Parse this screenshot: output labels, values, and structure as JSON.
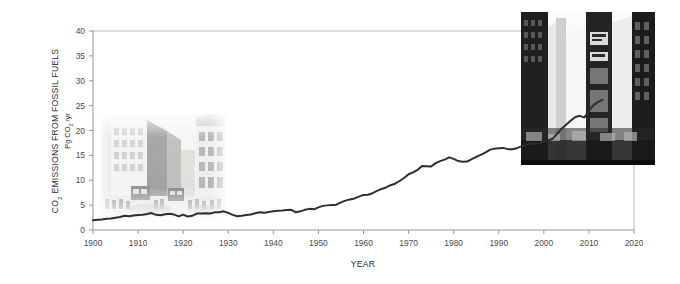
{
  "chart_data": {
    "type": "line",
    "title": "",
    "xlabel": "YEAR",
    "ylabel": "CO2 EMISSIONS FROM FOSSIL FUELS",
    "ylabel_sub": "Pg CO2 /yr",
    "ylabel_main_prefix": "CO",
    "ylabel_main_sub": "2",
    "ylabel_main_rest": " EMISSIONS FROM FOSSIL FUELS",
    "ylabel_units_prefix": "Pg CO",
    "ylabel_units_sub": "2",
    "ylabel_units_rest": " /yr",
    "xlim": [
      1900,
      2020
    ],
    "ylim": [
      0,
      40
    ],
    "xticks": [
      1900,
      1910,
      1920,
      1930,
      1940,
      1950,
      1960,
      1970,
      1980,
      1990,
      2000,
      2010,
      2020
    ],
    "yticks": [
      0,
      5,
      10,
      15,
      20,
      25,
      30,
      35,
      40
    ],
    "grid": false,
    "legend": "none",
    "line_color": "#2e2e2e",
    "axis_color": "#8a8a8a",
    "frame_color": "#b4b4b4",
    "series": [
      {
        "name": "Global CO2 emissions from fossil fuels",
        "x": [
          1900,
          1901,
          1902,
          1903,
          1904,
          1905,
          1906,
          1907,
          1908,
          1909,
          1910,
          1911,
          1912,
          1913,
          1914,
          1915,
          1916,
          1917,
          1918,
          1919,
          1920,
          1921,
          1922,
          1923,
          1924,
          1925,
          1926,
          1927,
          1928,
          1929,
          1930,
          1931,
          1932,
          1933,
          1934,
          1935,
          1936,
          1937,
          1938,
          1939,
          1940,
          1941,
          1942,
          1943,
          1944,
          1945,
          1946,
          1947,
          1948,
          1949,
          1950,
          1951,
          1952,
          1953,
          1954,
          1955,
          1956,
          1957,
          1958,
          1959,
          1960,
          1961,
          1962,
          1963,
          1964,
          1965,
          1966,
          1967,
          1968,
          1969,
          1970,
          1971,
          1972,
          1973,
          1974,
          1975,
          1976,
          1977,
          1978,
          1979,
          1980,
          1981,
          1982,
          1983,
          1984,
          1985,
          1986,
          1987,
          1988,
          1989,
          1990,
          1991,
          1992,
          1993,
          1994,
          1995,
          1996,
          1997,
          1998,
          1999,
          2000,
          2001,
          2002,
          2003,
          2004,
          2005,
          2006,
          2007,
          2008,
          2009,
          2010,
          2011,
          2012,
          2013
        ],
        "values": [
          1.95,
          2.05,
          2.1,
          2.25,
          2.3,
          2.45,
          2.6,
          2.85,
          2.75,
          2.9,
          3.0,
          3.05,
          3.2,
          3.4,
          3.05,
          2.95,
          3.15,
          3.25,
          3.1,
          2.75,
          3.1,
          2.7,
          2.85,
          3.3,
          3.3,
          3.35,
          3.3,
          3.55,
          3.55,
          3.75,
          3.45,
          3.05,
          2.75,
          2.85,
          3.0,
          3.1,
          3.35,
          3.55,
          3.45,
          3.6,
          3.75,
          3.85,
          3.9,
          4.0,
          4.05,
          3.55,
          3.75,
          4.05,
          4.25,
          4.15,
          4.55,
          4.85,
          4.95,
          5.05,
          5.1,
          5.55,
          5.9,
          6.15,
          6.35,
          6.7,
          7.05,
          7.1,
          7.4,
          7.85,
          8.25,
          8.55,
          9.0,
          9.3,
          9.85,
          10.45,
          11.2,
          11.6,
          12.1,
          12.85,
          12.8,
          12.75,
          13.45,
          13.85,
          14.15,
          14.6,
          14.3,
          13.85,
          13.7,
          13.75,
          14.25,
          14.7,
          15.1,
          15.55,
          16.1,
          16.35,
          16.45,
          16.5,
          16.25,
          16.25,
          16.45,
          16.8,
          17.2,
          17.35,
          17.35,
          17.4,
          17.8,
          18.05,
          18.35,
          19.4,
          20.4,
          21.2,
          22.0,
          22.7,
          22.95,
          22.6,
          24.0,
          25.1,
          25.7,
          26.15
        ]
      }
    ],
    "annotations": [
      {
        "name": "vintage-street-photo",
        "description": "Faded black-and-white photograph of an early-1900s city street with trams, carriages and stone buildings, overlaid across the 1905-1930 region of the plot"
      },
      {
        "name": "modern-city-photo",
        "description": "Black-and-white photograph of a modern skyscraper city canyon with large billboards, overlaid across the 1995-2020 region of the plot"
      }
    ]
  },
  "plot_geometry": {
    "left": 93,
    "right": 634,
    "top": 31,
    "bottom": 230
  },
  "photos": {
    "vintage": {
      "x": 100,
      "y": 114,
      "w": 126,
      "h": 103
    },
    "modern": {
      "x": 521,
      "y": 12,
      "w": 134,
      "h": 153
    }
  }
}
